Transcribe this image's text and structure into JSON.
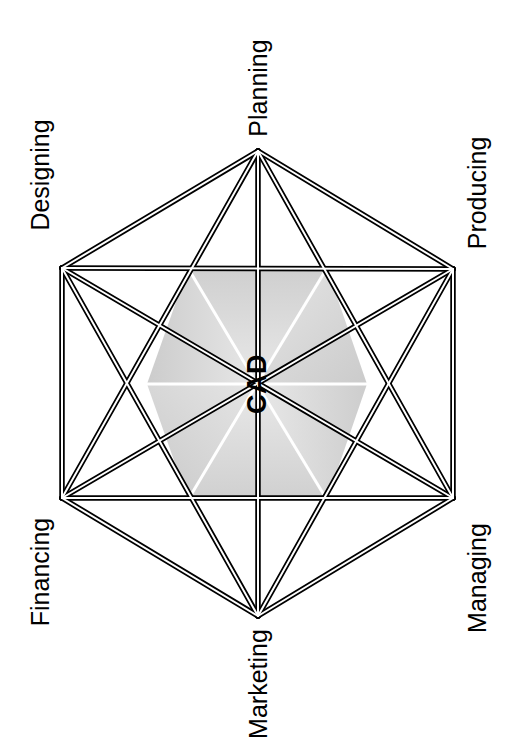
{
  "diagram": {
    "type": "hexagon-network",
    "title_center": "CAD",
    "nodes": [
      {
        "id": "planning",
        "label": "Planning",
        "x": 258,
        "y": 151,
        "label_x": 258,
        "label_y": 88
      },
      {
        "id": "producing",
        "label": "Producing",
        "x": 453,
        "y": 269,
        "label_x": 477,
        "label_y": 193
      },
      {
        "id": "managing",
        "label": "Managing",
        "x": 453,
        "y": 498,
        "label_x": 477,
        "label_y": 578
      },
      {
        "id": "marketing",
        "label": "Marketing",
        "x": 258,
        "y": 616,
        "label_x": 258,
        "label_y": 684
      },
      {
        "id": "financing",
        "label": "Financing",
        "x": 62,
        "y": 498,
        "label_x": 40,
        "label_y": 572
      },
      {
        "id": "designing",
        "label": "Designing",
        "x": 62,
        "y": 268,
        "label_x": 40,
        "label_y": 175
      }
    ],
    "edges": [
      [
        "planning",
        "producing"
      ],
      [
        "planning",
        "managing"
      ],
      [
        "planning",
        "marketing"
      ],
      [
        "planning",
        "financing"
      ],
      [
        "planning",
        "designing"
      ],
      [
        "producing",
        "managing"
      ],
      [
        "producing",
        "marketing"
      ],
      [
        "producing",
        "financing"
      ],
      [
        "producing",
        "designing"
      ],
      [
        "managing",
        "marketing"
      ],
      [
        "managing",
        "financing"
      ],
      [
        "managing",
        "designing"
      ],
      [
        "marketing",
        "financing"
      ],
      [
        "marketing",
        "designing"
      ],
      [
        "financing",
        "designing"
      ]
    ],
    "inner_hexagon": {
      "center_x": 257,
      "center_y": 384,
      "vertices": [
        {
          "x": 188,
          "y": 268
        },
        {
          "x": 327,
          "y": 268
        },
        {
          "x": 367,
          "y": 384
        },
        {
          "x": 327,
          "y": 500
        },
        {
          "x": 188,
          "y": 500
        },
        {
          "x": 147,
          "y": 384
        }
      ],
      "fill": "#d2d2d2",
      "divider_color": "#ffffff",
      "segment_count": 6
    },
    "style": {
      "line_color": "#000000",
      "background": "#ffffff",
      "double_line_outer_width": 5.5,
      "double_line_inner_width": 2.0,
      "text_color": "#000000"
    }
  }
}
